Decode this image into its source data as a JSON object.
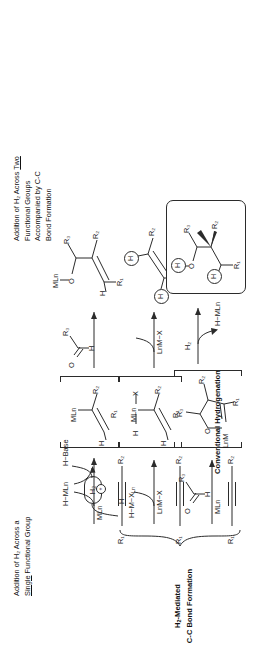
{
  "figure": {
    "type": "chemical-reaction-scheme",
    "orientation": "rotated-90-counterclockwise",
    "headers": {
      "left": {
        "line1": "Addition of H₂ Across a",
        "line2_underlined": "Single",
        "line2_rest": " Functional Group"
      },
      "right": {
        "line1_pre": "Addition of H₂ Across ",
        "line1_underlined": "Two",
        "line2": "Functional Groups",
        "line3": "Accompanied by C-C",
        "line4": "Bond Formation"
      }
    },
    "captions": {
      "left": {
        "line1": "Conventional",
        "line2": "Hydrogenation"
      },
      "right": {
        "line1": "H₂-Mediated",
        "line2": "C-C Bond Formation"
      }
    },
    "columns": [
      {
        "id": "column-1",
        "name": "conventional-hydrogenation-oxidative-addition",
        "starting_material": {
          "label_left": "R₁",
          "label_right": "R₂",
          "bond": "alkyne"
        },
        "reagent": "LnM−X",
        "product_of_step1": {
          "line1": "H",
          "line2": "H−M−X",
          "sub": "Ln"
        },
        "intermediate": {
          "metal_label": "MLn",
          "h_on_metal": "H",
          "x_on_metal": "X",
          "vinyl_h": "H",
          "r_alpha": "R₂",
          "r_beta": "R₁"
        },
        "arrow_reagent": "LnM−X",
        "product": {
          "h1": "H",
          "h2": "H",
          "r_top": "R₂",
          "r_bottom": "R₁"
        }
      },
      {
        "id": "column-2",
        "name": "conventional-hydrogenation-heterolytic",
        "starting_material": {
          "label_left": "R₁",
          "label_right": "R₂",
          "bond": "alkyne"
        },
        "reagent_cation": "MLn",
        "reagent_cation_charge": "+",
        "product_of_step1": "H−MLn",
        "byproduct": "H−Base",
        "intermediate": {
          "metal_label": "MLn",
          "vinyl_h": "H",
          "r_alpha": "R₂",
          "r_beta": "R₁"
        },
        "arrow_reagent": {
          "carbonyl_o": "O",
          "carbonyl_h": "H",
          "carbonyl_r": "R₃"
        },
        "product": {
          "oml": "MLn",
          "o": "O",
          "r3": "R₃",
          "r2": "R₂",
          "vinyl_h": "H",
          "r1": "R₁"
        }
      },
      {
        "id": "column-3",
        "name": "h2-mediated-cc-bond-formation",
        "starting_material": {
          "label_left": "R₁",
          "label_right": "R₂",
          "bond": "alkyne"
        },
        "reagent_metal": "MLn",
        "reagent_aldehyde": {
          "o": "O",
          "h": "H",
          "r3": "R₃"
        },
        "intermediate": {
          "metal_label": "LnM",
          "o": "O",
          "r3": "R₃",
          "r2": "R₂",
          "r1": "R₁"
        },
        "arrow_reagent": "H₂",
        "arrow_byproduct": "H−MLn",
        "product": {
          "oh_h": "H",
          "o": "O",
          "r3": "R₃",
          "r2": "R₂",
          "ch_h": "H",
          "r1": "R₁",
          "boxed": true
        }
      }
    ],
    "shared": {
      "h2_reagent_box": "H₂",
      "colors": {
        "ink": "#2b2b2b",
        "background": "#ffffff"
      }
    }
  }
}
